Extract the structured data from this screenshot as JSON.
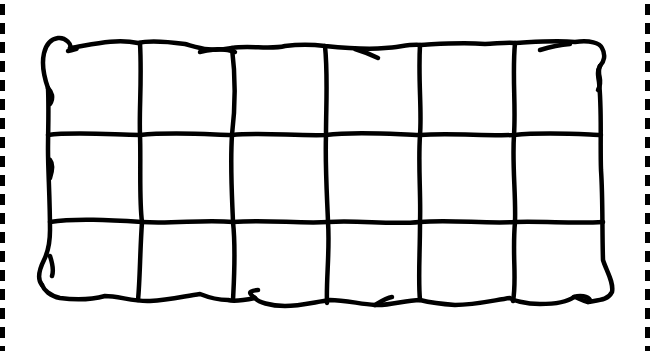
{
  "image": {
    "subject": "quilted mattress line drawing",
    "style": "black outline coloring page",
    "grid": {
      "columns": 6,
      "rows": 3
    },
    "colors": {
      "stroke": "#000000",
      "background": "#ffffff",
      "dashed_border": "#000000"
    },
    "border": {
      "left": "dashed",
      "right": "dashed",
      "top": "none",
      "bottom": "none"
    }
  }
}
